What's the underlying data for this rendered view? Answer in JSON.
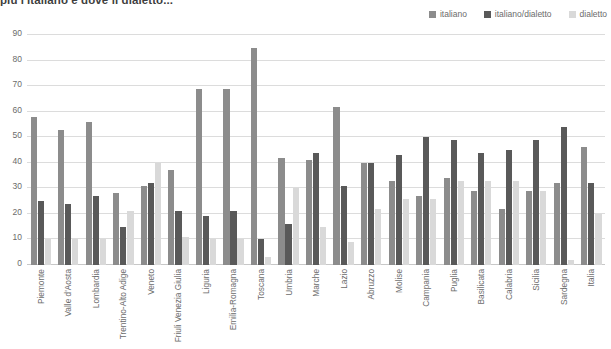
{
  "title": "più l'italiano e dove il dialetto...",
  "legend": {
    "position": "top-right",
    "items": [
      {
        "label": "italiano",
        "color": "#8c8c8c"
      },
      {
        "label": "italiano/dialetto",
        "color": "#595959"
      },
      {
        "label": "dialetto",
        "color": "#d9d9d9"
      }
    ]
  },
  "chart_data": {
    "type": "bar",
    "title": "più l'italiano e dove il dialetto...",
    "xlabel": "",
    "ylabel": "",
    "ylim": [
      0,
      90
    ],
    "yticks": [
      0,
      10,
      20,
      30,
      40,
      50,
      60,
      70,
      80,
      90
    ],
    "grid": true,
    "categories": [
      "Piemonte",
      "Valle d'Aosta",
      "Lombardia",
      "Trentino-Alto Adige",
      "Veneto",
      "Friuli Venezia Giulia",
      "Liguria",
      "Emilia-Romagna",
      "Toscana",
      "Umbria",
      "Marche",
      "Lazio",
      "Abruzzo",
      "Molise",
      "Campania",
      "Puglia",
      "Basilicata",
      "Calabria",
      "Sicilia",
      "Sardegna",
      "Italia"
    ],
    "series": [
      {
        "name": "italiano",
        "color": "#8c8c8c",
        "values": [
          58,
          53,
          56,
          28,
          31,
          37,
          69,
          69,
          85,
          42,
          41,
          62,
          40,
          33,
          27,
          34,
          29,
          22,
          29,
          32,
          46
        ]
      },
      {
        "name": "italiano/dialetto",
        "color": "#595959",
        "values": [
          25,
          24,
          27,
          15,
          32,
          21,
          19,
          21,
          10,
          16,
          44,
          31,
          40,
          43,
          50,
          49,
          44,
          45,
          49,
          54,
          32
        ]
      },
      {
        "name": "dialetto",
        "color": "#d9d9d9",
        "values": [
          10,
          10,
          10,
          21,
          40,
          11,
          10,
          10,
          3,
          30,
          15,
          9,
          22,
          26,
          26,
          33,
          33,
          33,
          29,
          2,
          20
        ]
      }
    ]
  }
}
